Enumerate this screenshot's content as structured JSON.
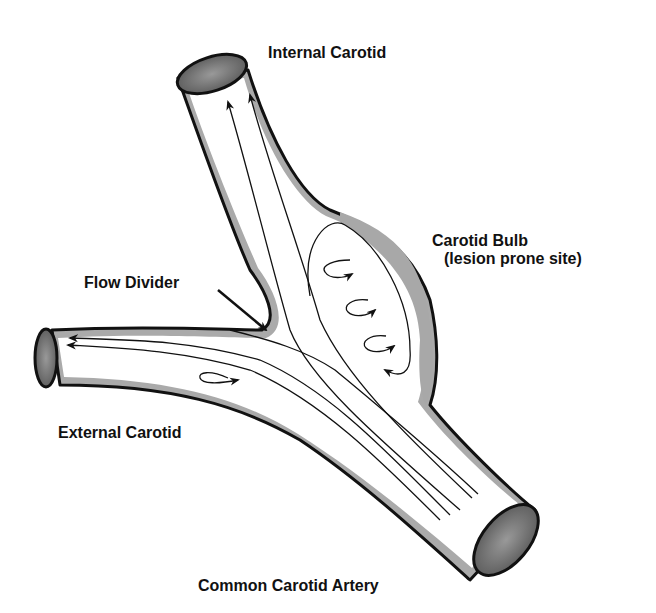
{
  "diagram": {
    "colors": {
      "outline": "#111111",
      "wall": "#aaaaaa",
      "bulb_plaque": "#a8a8a8",
      "lumen_opening": "#777777",
      "lumen_fill": "#ffffff",
      "flow_line": "#111111"
    },
    "labels": {
      "internal_carotid": "Internal Carotid",
      "carotid_bulb": "Carotid Bulb",
      "carotid_bulb_note": "(lesion prone site)",
      "flow_divider": "Flow Divider",
      "external_carotid": "External Carotid",
      "common_carotid": "Common Carotid Artery"
    },
    "nodes": [
      {
        "id": "internal_carotid",
        "label": "Internal Carotid",
        "type": "vessel-branch"
      },
      {
        "id": "external_carotid",
        "label": "External Carotid",
        "type": "vessel-branch"
      },
      {
        "id": "common_carotid",
        "label": "Common Carotid Artery",
        "type": "vessel-trunk"
      },
      {
        "id": "carotid_bulb",
        "label": "Carotid Bulb (lesion prone site)",
        "type": "region"
      },
      {
        "id": "flow_divider",
        "label": "Flow Divider",
        "type": "region"
      }
    ],
    "edges": [
      {
        "from": "common_carotid",
        "to": "internal_carotid",
        "kind": "laminar-flow",
        "arrows": 2
      },
      {
        "from": "common_carotid",
        "to": "external_carotid",
        "kind": "laminar-flow",
        "arrows": 2
      },
      {
        "from": "carotid_bulb",
        "to": "carotid_bulb",
        "kind": "recirculation-vortex",
        "arrows": 4
      },
      {
        "from": "external_carotid",
        "to": "external_carotid",
        "kind": "recirculation-vortex",
        "arrows": 1
      },
      {
        "from": "flow_divider_label",
        "to": "flow_divider",
        "kind": "pointer-arrow"
      }
    ]
  }
}
